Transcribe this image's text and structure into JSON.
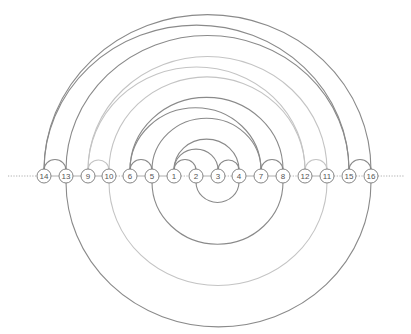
{
  "diagram": {
    "type": "arc-diagram",
    "baseline_y": 176,
    "node_radius": 7,
    "colors": {
      "dark_arc": "#8a8a8a",
      "light_arc": "#c4c4c4",
      "node_stroke": "#777777",
      "node_fill": "#ffffff",
      "label": "#555555",
      "axis": "#999999"
    },
    "nodes": [
      {
        "id": "14",
        "label": "14",
        "x": 44
      },
      {
        "id": "13",
        "label": "13",
        "x": 66
      },
      {
        "id": "9",
        "label": "9",
        "x": 88
      },
      {
        "id": "10",
        "label": "10",
        "x": 109
      },
      {
        "id": "6",
        "label": "6",
        "x": 130
      },
      {
        "id": "5",
        "label": "5",
        "x": 152
      },
      {
        "id": "1",
        "label": "1",
        "x": 174
      },
      {
        "id": "2",
        "label": "2",
        "x": 196
      },
      {
        "id": "3",
        "label": "3",
        "x": 218
      },
      {
        "id": "4",
        "label": "4",
        "x": 239
      },
      {
        "id": "7",
        "label": "7",
        "x": 261
      },
      {
        "id": "8",
        "label": "8",
        "x": 283
      },
      {
        "id": "12",
        "label": "12",
        "x": 305
      },
      {
        "id": "11",
        "label": "11",
        "x": 327
      },
      {
        "id": "15",
        "label": "15",
        "x": 349
      },
      {
        "id": "16",
        "label": "16",
        "x": 371
      }
    ],
    "segments": [
      {
        "from": "14",
        "to": "13",
        "style": "solid"
      },
      {
        "from": "13",
        "to": "9",
        "style": "solid"
      },
      {
        "from": "9",
        "to": "10",
        "style": "solid"
      },
      {
        "from": "10",
        "to": "6",
        "style": "dotted"
      },
      {
        "from": "6",
        "to": "5",
        "style": "solid"
      },
      {
        "from": "5",
        "to": "1",
        "style": "solid"
      },
      {
        "from": "1",
        "to": "2",
        "style": "dotted"
      },
      {
        "from": "2",
        "to": "3",
        "style": "solid"
      },
      {
        "from": "3",
        "to": "4",
        "style": "dotted"
      },
      {
        "from": "4",
        "to": "7",
        "style": "solid"
      },
      {
        "from": "7",
        "to": "8",
        "style": "solid"
      },
      {
        "from": "8",
        "to": "12",
        "style": "dotted"
      },
      {
        "from": "12",
        "to": "11",
        "style": "solid"
      },
      {
        "from": "11",
        "to": "15",
        "style": "dotted"
      },
      {
        "from": "15",
        "to": "16",
        "style": "dotted"
      }
    ],
    "arcs_above": [
      {
        "from": "14",
        "to": "13",
        "tone": "dark"
      },
      {
        "from": "9",
        "to": "10",
        "tone": "light"
      },
      {
        "from": "6",
        "to": "5",
        "tone": "dark"
      },
      {
        "from": "1",
        "to": "2",
        "tone": "dark"
      },
      {
        "from": "3",
        "to": "4",
        "tone": "dark"
      },
      {
        "from": "7",
        "to": "8",
        "tone": "dark"
      },
      {
        "from": "12",
        "to": "11",
        "tone": "light"
      },
      {
        "from": "15",
        "to": "16",
        "tone": "dark"
      },
      {
        "from": "1",
        "to": "3",
        "tone": "dark"
      },
      {
        "from": "1",
        "to": "4",
        "tone": "dark"
      },
      {
        "from": "5",
        "to": "7",
        "tone": "dark"
      },
      {
        "from": "6",
        "to": "7",
        "tone": "dark"
      },
      {
        "from": "6",
        "to": "8",
        "tone": "dark"
      },
      {
        "from": "10",
        "to": "12",
        "tone": "light"
      },
      {
        "from": "9",
        "to": "12",
        "tone": "light"
      },
      {
        "from": "9",
        "to": "11",
        "tone": "light"
      },
      {
        "from": "13",
        "to": "15",
        "tone": "dark"
      },
      {
        "from": "14",
        "to": "15",
        "tone": "dark"
      },
      {
        "from": "14",
        "to": "16",
        "tone": "dark"
      }
    ],
    "arcs_below": [
      {
        "from": "2",
        "to": "4",
        "tone": "dark"
      },
      {
        "from": "5",
        "to": "8",
        "tone": "dark"
      },
      {
        "from": "10",
        "to": "11",
        "tone": "light"
      },
      {
        "from": "13",
        "to": "16",
        "tone": "dark"
      }
    ]
  }
}
